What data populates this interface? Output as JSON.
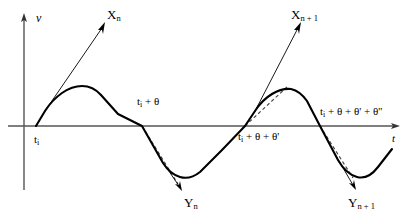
{
  "figure": {
    "kind": "waveform-diagram",
    "background_color": "#ffffff",
    "curve_color": "#000000",
    "axis_color": "#555555",
    "dashed_color": "#444444"
  },
  "axes": {
    "vertical": {
      "label": "v",
      "label_main": "v",
      "x": 24,
      "top_y": 16,
      "bottom_y": 190
    },
    "horizontal": {
      "label": "t",
      "label_main": "t",
      "y": 126,
      "left_x": 8,
      "right_x": 398
    }
  },
  "time_labels": [
    {
      "id": "t-i",
      "main": "t",
      "subscript": "i",
      "suffix": "",
      "x": 34,
      "y": 134
    },
    {
      "id": "t-i-plus-theta",
      "main": "t",
      "subscript": "i",
      "suffix": " + θ",
      "x": 137,
      "y": 96
    },
    {
      "id": "t-i-plus-theta-thetap",
      "main": "t",
      "subscript": "i",
      "suffix": " + θ + θ'",
      "x": 238,
      "y": 131
    },
    {
      "id": "t-i-plus-theta-thetap-thetapp",
      "main": "t",
      "subscript": "i",
      "suffix": " + θ + θ' + θ''",
      "x": 320,
      "y": 106
    }
  ],
  "event_labels": [
    {
      "id": "X-n",
      "main": "X",
      "subscript": "n",
      "x": 107,
      "y": 8
    },
    {
      "id": "X-n-plus-1",
      "main": "X",
      "subscript": "n + 1",
      "x": 291,
      "y": 8
    },
    {
      "id": "Y-n",
      "main": "Y",
      "subscript": "n",
      "x": 184,
      "y": 196
    },
    {
      "id": "Y-n-plus-1",
      "main": "Y",
      "subscript": "n + 1",
      "x": 348,
      "y": 196
    }
  ],
  "geometry": {
    "wave_path": "M 36 126 L 45 111 Q 52 100 62 93 Q 72 86 82 86 Q 93 86 101 95 Q 109 104 118 114 L 142 126 L 163 163 Q 170 174 180 177 Q 190 180 200 172 L 222 150 L 245 126 L 255 111 Q 262 100 272 94 Q 282 88 291 89 Q 300 91 307 101 L 320 126 L 338 160 Q 346 174 357 177 Q 368 180 378 167 L 392 149",
    "tangent_solid_lines": [
      {
        "id": "tangent-Xn",
        "x1": 45,
        "y1": 111,
        "x2": 104,
        "y2": 24
      },
      {
        "id": "tangent-Xn1",
        "x1": 254,
        "y1": 113,
        "x2": 300,
        "y2": 24
      }
    ],
    "tangent_dashed_lines": [
      {
        "id": "tangent-dashed-Yn",
        "x1": 142,
        "y1": 126,
        "x2": 178,
        "y2": 184
      },
      {
        "id": "tangent-dashed-Xn1",
        "x1": 245,
        "y1": 126,
        "x2": 288,
        "y2": 86
      },
      {
        "id": "tangent-dashed-Yn1",
        "x1": 320,
        "y1": 126,
        "x2": 353,
        "y2": 178
      }
    ],
    "arrows": [
      {
        "id": "arrow-Xn",
        "x1": 45,
        "y1": 111,
        "x2": 104,
        "y2": 24,
        "head": "end"
      },
      {
        "id": "arrow-Xn1",
        "x1": 254,
        "y1": 113,
        "x2": 300,
        "y2": 24,
        "head": "end"
      },
      {
        "id": "arrow-Yn",
        "x1": 160,
        "y1": 158,
        "x2": 181,
        "y2": 189,
        "head": "end"
      },
      {
        "id": "arrow-Yn1",
        "x1": 336,
        "y1": 156,
        "x2": 355,
        "y2": 188,
        "head": "end"
      }
    ]
  }
}
